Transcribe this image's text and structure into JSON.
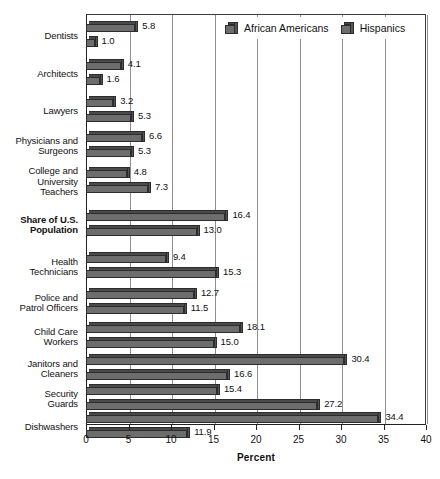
{
  "chart_data": {
    "type": "bar",
    "orientation": "horizontal",
    "title": "",
    "xlabel": "Percent",
    "ylabel": "",
    "xlim": [
      0,
      40
    ],
    "xticks": [
      0,
      5,
      10,
      15,
      20,
      25,
      30,
      35,
      40
    ],
    "grid": "vertical",
    "legend_position": "top-right-inside",
    "categories": [
      "Dentists",
      "Architects",
      "Lawyers",
      "Physicians and Surgeons",
      "College and University Teachers",
      "Share of U.S. Population",
      "Health Technicians",
      "Police and Patrol Officers",
      "Child Care Workers",
      "Janitors and Cleaners",
      "Security Guards",
      "Dishwashers"
    ],
    "series": [
      {
        "name": "African Americans",
        "values": [
          5.8,
          4.1,
          3.2,
          6.6,
          4.8,
          16.4,
          9.4,
          12.7,
          18.1,
          30.4,
          15.4,
          34.4
        ]
      },
      {
        "name": "Hispanics",
        "values": [
          1.0,
          1.6,
          5.3,
          5.3,
          7.3,
          13.0,
          15.3,
          11.5,
          15.0,
          16.6,
          27.2,
          11.9
        ]
      }
    ],
    "colors": {
      "bar_fill": "#6d6d6d",
      "bar_edge": "#2c2c2c",
      "bar_top": "#4a4a4a",
      "bar_side": "#555555",
      "gridline": "#8e8e8e",
      "axis": "#222222",
      "background": "#ffffff"
    }
  },
  "categories_display": [
    {
      "lines": [
        "Dentists"
      ],
      "bold": false
    },
    {
      "lines": [
        "Architects"
      ],
      "bold": false
    },
    {
      "lines": [
        "Lawyers"
      ],
      "bold": false
    },
    {
      "lines": [
        "Physicians and",
        "Surgeons"
      ],
      "bold": false
    },
    {
      "lines": [
        "College and",
        "University",
        "Teachers"
      ],
      "bold": false
    },
    {
      "lines": [
        "Share of U.S.",
        "Population"
      ],
      "bold": true
    },
    {
      "lines": [
        "Health",
        "Technicians"
      ],
      "bold": false
    },
    {
      "lines": [
        "Police and",
        "Patrol Officers"
      ],
      "bold": false
    },
    {
      "lines": [
        "Child Care",
        "Workers"
      ],
      "bold": false
    },
    {
      "lines": [
        "Janitors and",
        "Cleaners"
      ],
      "bold": false
    },
    {
      "lines": [
        "Security",
        "Guards"
      ],
      "bold": false
    },
    {
      "lines": [
        "Dishwashers"
      ],
      "bold": false
    }
  ],
  "legend": {
    "items": [
      {
        "label": "African Americans",
        "swatch": "cube-swatch"
      },
      {
        "label": "Hispanics",
        "swatch": "cube-swatch"
      }
    ]
  },
  "axis": {
    "x_title": "Percent",
    "x_tick_labels": [
      "0",
      "5",
      "10",
      "15",
      "20",
      "25",
      "30",
      "35",
      "40"
    ]
  }
}
